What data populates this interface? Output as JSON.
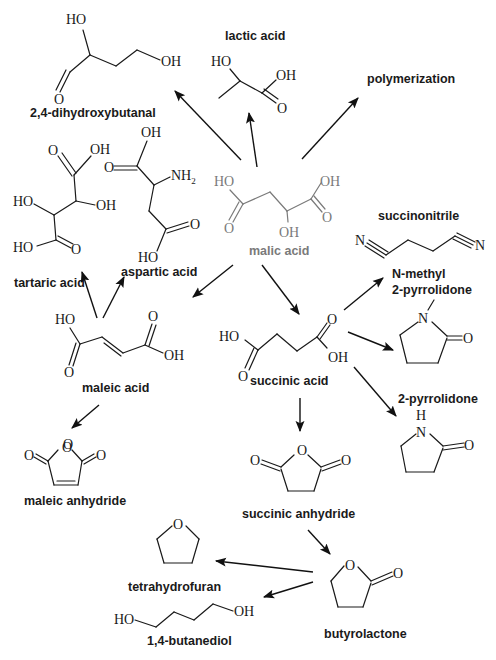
{
  "diagram": {
    "center": {
      "name": "malic acid",
      "color": "#7a7a7a"
    },
    "compounds": [
      {
        "id": "dihydroxybutanal",
        "label": "2,4-dihydroxybutanal",
        "atoms": [
          "HO",
          "OH",
          "O"
        ]
      },
      {
        "id": "lactic",
        "label": "lactic acid",
        "atoms": [
          "HO",
          "OH",
          "O"
        ]
      },
      {
        "id": "polymerization",
        "label": "polymerization",
        "atoms": []
      },
      {
        "id": "tartaric",
        "label": "tartaric acid",
        "atoms": [
          "O",
          "OH",
          "HO",
          "OH",
          "HO",
          "O"
        ]
      },
      {
        "id": "aspartic",
        "label": "aspartic acid",
        "atoms": [
          "OH",
          "O",
          "NH2",
          "O",
          "HO"
        ]
      },
      {
        "id": "malic",
        "label": "malic acid",
        "atoms": [
          "HO",
          "O",
          "OH",
          "O",
          "OH"
        ]
      },
      {
        "id": "succinonitrile",
        "label": "succinonitrile",
        "atoms": [
          "N",
          "N"
        ]
      },
      {
        "id": "nmp",
        "label_line1": "N-methyl",
        "label_line2": "2-pyrrolidone",
        "atoms": [
          "N",
          "O"
        ]
      },
      {
        "id": "maleic",
        "label": "maleic acid",
        "atoms": [
          "HO",
          "O",
          "O",
          "OH"
        ]
      },
      {
        "id": "succinic",
        "label": "succinic acid",
        "atoms": [
          "HO",
          "O",
          "O",
          "OH"
        ]
      },
      {
        "id": "pyrrolidone",
        "label": "2-pyrrolidone",
        "atoms": [
          "H",
          "N",
          "O"
        ]
      },
      {
        "id": "maleic_anhydride",
        "label": "maleic anhydride",
        "atoms": [
          "O",
          "O",
          "O"
        ]
      },
      {
        "id": "succinic_anhydride",
        "label": "succinic anhydride",
        "atoms": [
          "O",
          "O",
          "O"
        ]
      },
      {
        "id": "thf",
        "label": "tetrahydrofuran",
        "atoms": [
          "O"
        ]
      },
      {
        "id": "bdo",
        "label": "1,4-butanediol",
        "atoms": [
          "HO",
          "OH"
        ]
      },
      {
        "id": "gbl",
        "label": "butyrolactone",
        "atoms": [
          "O",
          "O"
        ]
      }
    ],
    "arrows": [
      {
        "from": "malic acid",
        "to": "2,4-dihydroxybutanal"
      },
      {
        "from": "malic acid",
        "to": "lactic acid"
      },
      {
        "from": "malic acid",
        "to": "polymerization"
      },
      {
        "from": "malic acid",
        "to": "maleic acid"
      },
      {
        "from": "malic acid",
        "to": "succinic acid"
      },
      {
        "from": "maleic acid",
        "to": "tartaric acid"
      },
      {
        "from": "maleic acid",
        "to": "aspartic acid"
      },
      {
        "from": "maleic acid",
        "to": "maleic anhydride"
      },
      {
        "from": "succinic acid",
        "to": "succinonitrile"
      },
      {
        "from": "succinic acid",
        "to": "N-methyl 2-pyrrolidone"
      },
      {
        "from": "succinic acid",
        "to": "2-pyrrolidone"
      },
      {
        "from": "succinic acid",
        "to": "succinic anhydride"
      },
      {
        "from": "succinic anhydride",
        "to": "butyrolactone"
      },
      {
        "from": "butyrolactone",
        "to": "tetrahydrofuran"
      },
      {
        "from": "butyrolactone",
        "to": "1,4-butanediol"
      }
    ]
  }
}
